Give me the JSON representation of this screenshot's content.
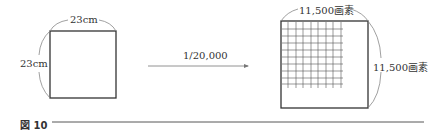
{
  "figure": {
    "caption": "図 10",
    "left": {
      "top_label": "23cm",
      "side_label": "23cm"
    },
    "arrow": {
      "label": "1/20,000"
    },
    "right": {
      "top_label": "11,500画素",
      "side_label": "11,500画素",
      "grid_lines": 9
    }
  }
}
